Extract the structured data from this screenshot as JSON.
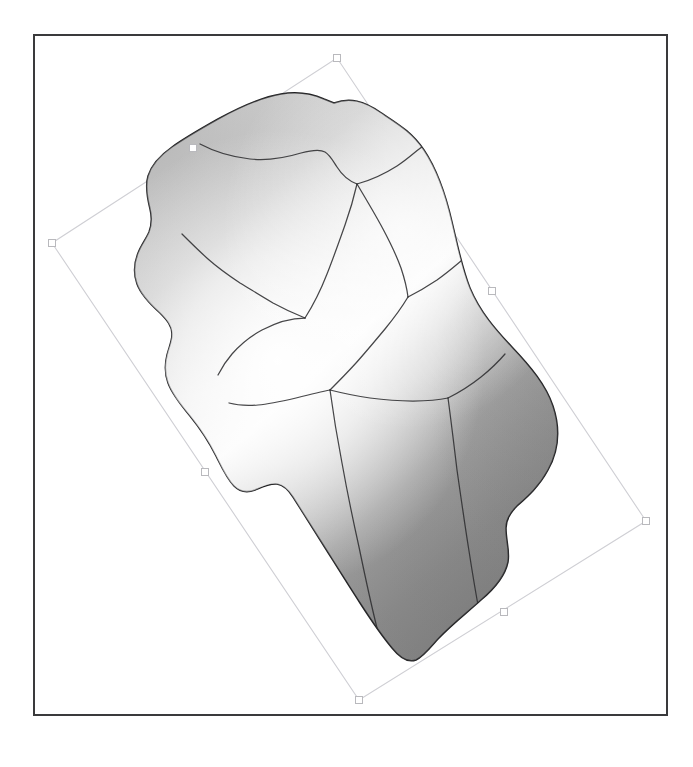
{
  "document": {
    "title": "Gradient Mesh Shape Selection",
    "app_kind": "vector-illustration-canvas",
    "artboard": {
      "x": 33,
      "y": 34,
      "width": 635,
      "height": 682,
      "border_color": "#3a3a3c",
      "background_color": "#ffffff"
    }
  },
  "selection": {
    "label": "Selected object",
    "rotated": true,
    "rotation_degrees": -37,
    "box_stroke_color": "#cfcfd4",
    "handle_fill_color": "#ffffff",
    "handle_stroke_color": "#b9b9bd",
    "handle_size": 7,
    "corners": [
      {
        "name": "handle-top",
        "x": 337,
        "y": 58
      },
      {
        "name": "handle-right",
        "x": 646,
        "y": 521
      },
      {
        "name": "handle-bottom",
        "x": 359,
        "y": 700
      },
      {
        "name": "handle-left",
        "x": 52,
        "y": 243
      }
    ],
    "midpoints": [
      {
        "name": "handle-top-left-mid",
        "x": 193,
        "y": 148
      },
      {
        "name": "handle-top-right-mid",
        "x": 492,
        "y": 291
      },
      {
        "name": "handle-bottom-right-mid",
        "x": 504,
        "y": 612
      },
      {
        "name": "handle-bottom-left-mid",
        "x": 205,
        "y": 472
      }
    ]
  },
  "artwork": {
    "name": "organic-mesh-blob",
    "fill_type": "gradient-mesh",
    "outline_color": "#1f1f21",
    "outline_width": 1.5,
    "mesh_line_color": "#2e2e30",
    "mesh_line_count": 9,
    "gradient_stops": [
      {
        "position": "highlight-core",
        "color": "#fdfdfd"
      },
      {
        "position": "upper-left-midtone",
        "color": "#c9c9c9"
      },
      {
        "position": "upper-right-midtone",
        "color": "#d7d7d7"
      },
      {
        "position": "lower-shadow",
        "color": "#8f8f8f"
      },
      {
        "position": "deep-shadow",
        "color": "#828282"
      }
    ],
    "outline_path": "M 334 103 C 350 97 364 101 380 112 C 398 124 412 132 424 150 C 438 171 446 196 452 222 C 458 247 462 268 470 288 C 480 312 496 330 512 347 C 531 367 546 385 553 406 C 561 430 558 452 548 470 C 539 487 526 498 517 506 C 511 512 506 519 506 528 C 506 541 510 551 508 562 C 505 577 494 589 481 600 C 468 612 452 624 438 639 C 430 648 423 657 416 660 C 408 663 400 658 392 648 C 382 636 371 620 360 603 C 347 583 334 562 322 543 C 310 524 300 508 293 497 C 288 489 283 485 277 484 C 270 483 262 487 255 490 C 247 493 240 492 234 486 C 227 479 222 468 216 456 C 208 440 199 427 190 416 C 180 404 172 394 168 383 C 164 372 165 363 167 355 C 169 347 172 341 172 334 C 172 326 167 320 160 313 C 150 304 141 295 137 284 C 133 273 134 263 138 253 C 141 245 146 239 149 232 C 152 224 152 217 150 209 C 147 197 145 186 148 176 C 152 163 162 154 172 147 C 186 137 202 128 218 119 C 240 107 262 97 281 94 C 299 91 315 95 324 99 Z",
    "mesh_paths": [
      "M 200 144 C 215 152 232 157 250 159 C 270 161 288 157 301 153 C 312 150 320 149 325 152 C 330 155 333 161 337 167 C 342 175 349 181 357 184",
      "M 357 184 C 372 180 386 173 397 166 C 408 159 416 151 423 146",
      "M 357 184 C 354 197 350 211 345 225 C 339 242 333 259 327 274 C 320 292 312 307 305 318",
      "M 357 184 C 366 199 375 214 383 229 C 391 244 397 257 401 268 C 405 280 407 289 408 297",
      "M 408 297 C 418 292 428 286 437 280 C 447 273 455 266 461 261",
      "M 408 297 C 402 307 394 318 385 329 C 375 341 365 353 356 363 C 346 374 337 383 330 390",
      "M 305 318 C 290 318 275 323 262 330 C 249 337 239 346 232 354 C 225 362 221 369 218 375",
      "M 305 318 C 295 314 284 309 273 303 C 261 296 250 289 240 283 C 228 275 217 267 208 259 C 198 250 189 241 182 234",
      "M 330 390 C 320 392 308 395 296 398 C 283 401 270 404 258 405 C 246 406 236 405 229 403",
      "M 330 390 C 342 393 356 396 370 398 C 385 400 400 401 413 401 C 427 401 439 400 448 398",
      "M 448 398 C 460 392 471 385 481 377 C 491 369 499 361 505 354",
      "M 330 390 C 333 412 337 437 342 463 C 347 491 353 520 359 547 C 365 576 371 604 377 628 C 382 647 386 660 389 668",
      "M 448 398 C 451 420 454 445 457 470 C 461 498 465 526 469 551 C 473 577 477 600 480 616"
    ]
  },
  "status": {
    "visible_text_count": 0,
    "note": "No visible UI text, labels, menus, or numbers are rendered in this screenshot."
  }
}
